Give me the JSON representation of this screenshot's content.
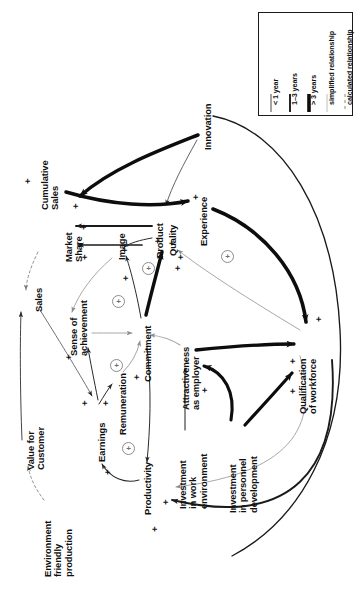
{
  "figure": {
    "orientation": "rotated-90-ccw",
    "background": "#ffffff",
    "ink": "#101010",
    "grey_link": "#9a9a9a"
  },
  "legend": {
    "name": "relationship-legend",
    "items": [
      {
        "label": "< 1 year",
        "style": "thin-solid",
        "color": "#2a2a2a",
        "width": 1.0
      },
      {
        "label": "1–3 years",
        "style": "medium-solid",
        "color": "#1a1a1a",
        "width": 1.9
      },
      {
        "label": "> 3 years",
        "style": "thick-solid",
        "color": "#0d0d0d",
        "width": 3.6
      },
      {
        "label": "simplified relationship",
        "style": "grey-solid",
        "color": "#b4b4b4",
        "width": 1.0
      },
      {
        "label": "calculated relationship",
        "style": "dashed",
        "color": "#8a8a8a",
        "width": 1.0
      }
    ]
  },
  "nodes": [
    {
      "id": "innovation",
      "label": "Innovation"
    },
    {
      "id": "cumulative_sales",
      "label": "Cumulative\nSales"
    },
    {
      "id": "market_share",
      "label": "Market\nShare"
    },
    {
      "id": "experience",
      "label": "Experience"
    },
    {
      "id": "image",
      "label": "Image"
    },
    {
      "id": "product",
      "label": "Product"
    },
    {
      "id": "quality",
      "label": "Quality"
    },
    {
      "id": "sales",
      "label": "Sales"
    },
    {
      "id": "sense_of_achievement",
      "label": "Sense of\nachievement"
    },
    {
      "id": "commitment",
      "label": "Commitment"
    },
    {
      "id": "attractiveness",
      "label": "Attractiveness\nas employer"
    },
    {
      "id": "qualification",
      "label": "Qualification\nof workforce"
    },
    {
      "id": "value_for_customer",
      "label": "Value for\nCustomer"
    },
    {
      "id": "earnings",
      "label": "Earnings"
    },
    {
      "id": "remuneration",
      "label": "Remuneration"
    },
    {
      "id": "productivity",
      "label": "Productivity"
    },
    {
      "id": "investment_work_env",
      "label": "Investment\nin work\nenvironment"
    },
    {
      "id": "investment_personnel",
      "label": "Investment\nin personnel\ndevelopment"
    },
    {
      "id": "environment_friendly",
      "label": "Environment\nfriendly\nproduction"
    }
  ],
  "polarities": {
    "symbol": "+",
    "count": 22
  },
  "loop_markers": {
    "symbol": "+",
    "count": 5,
    "meaning": "reinforcing loop"
  },
  "edges": [
    {
      "from": "innovation",
      "to": "market_share",
      "weight": "thick",
      "sign": "+"
    },
    {
      "from": "innovation",
      "to": "quality",
      "weight": "thin",
      "sign": "+"
    },
    {
      "from": "cumulative_sales",
      "to": "experience",
      "weight": "thick",
      "sign": "+"
    },
    {
      "from": "experience",
      "to": "qualification",
      "weight": "thick",
      "sign": "+"
    },
    {
      "from": "product",
      "to": "market_share",
      "weight": "medium",
      "sign": "+"
    },
    {
      "from": "quality",
      "to": "market_share",
      "weight": "medium",
      "sign": "+"
    },
    {
      "from": "quality",
      "to": "image",
      "weight": "thin",
      "sign": "+"
    },
    {
      "from": "commitment",
      "to": "quality",
      "weight": "thick",
      "sign": "+"
    },
    {
      "from": "commitment",
      "to": "image",
      "weight": "thin",
      "sign": "+"
    },
    {
      "from": "qualification",
      "to": "quality",
      "weight": "grey",
      "sign": "+"
    },
    {
      "from": "market_share",
      "to": "sales",
      "weight": "dashed",
      "sign": "+"
    },
    {
      "from": "image",
      "to": "sense_of_achievement",
      "weight": "grey",
      "sign": "+"
    },
    {
      "from": "sense_of_achievement",
      "to": "commitment",
      "weight": "grey",
      "sign": "+"
    },
    {
      "from": "attractiveness",
      "to": "commitment",
      "weight": "grey",
      "sign": "+"
    },
    {
      "from": "attractiveness",
      "to": "qualification",
      "weight": "thick",
      "sign": "+"
    },
    {
      "from": "remuneration",
      "to": "commitment",
      "weight": "grey",
      "sign": "+"
    },
    {
      "from": "earnings",
      "to": "remuneration",
      "weight": "thin",
      "sign": "+"
    },
    {
      "from": "earnings",
      "to": "sense_of_achievement",
      "weight": "thin",
      "sign": "+"
    },
    {
      "from": "sales",
      "to": "earnings",
      "weight": "thin",
      "sign": "+"
    },
    {
      "from": "productivity",
      "to": "earnings",
      "weight": "thin",
      "sign": "+"
    },
    {
      "from": "commitment",
      "to": "productivity",
      "weight": "thin",
      "sign": "+"
    },
    {
      "from": "investment_work_env",
      "to": "attractiveness",
      "weight": "thin",
      "sign": "+"
    },
    {
      "from": "investment_personnel",
      "to": "attractiveness",
      "weight": "thick",
      "sign": "+"
    },
    {
      "from": "investment_personnel",
      "to": "qualification",
      "weight": "thick",
      "sign": "+"
    },
    {
      "from": "qualification",
      "to": "productivity",
      "weight": "grey",
      "sign": "+"
    },
    {
      "from": "qualification",
      "to": "productivity_outer",
      "weight": "thin",
      "sign": "+"
    },
    {
      "from": "environment_friendly",
      "to": "value_for_customer",
      "weight": "dashed",
      "sign": ""
    },
    {
      "from": "value_for_customer",
      "to": "sales",
      "weight": "thin",
      "sign": "+"
    }
  ]
}
